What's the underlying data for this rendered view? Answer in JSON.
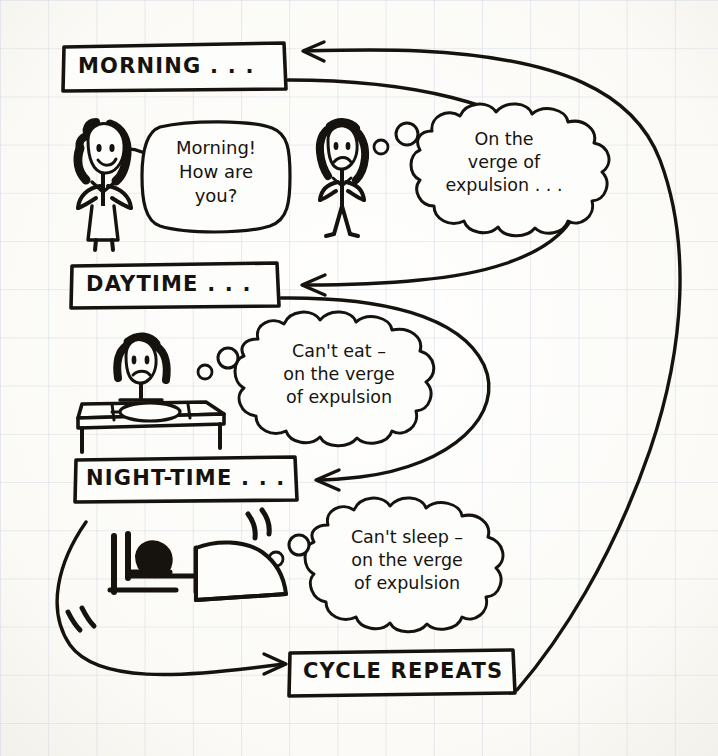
{
  "page": {
    "paper_color": "#fbfaf7",
    "grid_color": "#c9d2dd",
    "ink_color": "#16130f"
  },
  "stages": [
    {
      "id": "morning",
      "label": "MORNING . . .",
      "box": {
        "x": 62,
        "y": 44,
        "w": 222,
        "h": 46
      }
    },
    {
      "id": "daytime",
      "label": "DAYTIME . . .",
      "box": {
        "x": 70,
        "y": 263,
        "w": 208,
        "h": 44
      }
    },
    {
      "id": "nighttime",
      "label": "NIGHT-TIME . . .",
      "box": {
        "x": 74,
        "y": 457,
        "w": 222,
        "h": 44
      }
    },
    {
      "id": "cycle-repeats",
      "label": "CYCLE REPEATS",
      "box": {
        "x": 288,
        "y": 650,
        "w": 226,
        "h": 44
      }
    }
  ],
  "speech_bubbles": [
    {
      "id": "morning-greeting",
      "kind": "speech",
      "text": "Morning!\nHow are\nyou?",
      "box": {
        "x": 146,
        "y": 124,
        "w": 138,
        "h": 104
      }
    }
  ],
  "thought_bubbles": [
    {
      "id": "morning-thought",
      "kind": "thought",
      "text": "On the\nverge of\nexpulsion . . .",
      "box": {
        "x": 424,
        "y": 112,
        "w": 160,
        "h": 112
      },
      "dots": [
        {
          "cx": 381,
          "cy": 147,
          "r": 7
        },
        {
          "cx": 407,
          "cy": 134,
          "r": 11
        }
      ]
    },
    {
      "id": "daytime-thought",
      "kind": "thought",
      "text": "Can't eat –\non the verge\nof expulsion",
      "box": {
        "x": 248,
        "y": 322,
        "w": 186,
        "h": 110
      },
      "dots": [
        {
          "cx": 205,
          "cy": 372,
          "r": 7
        },
        {
          "cx": 228,
          "cy": 358,
          "r": 10
        }
      ]
    },
    {
      "id": "nighttime-thought",
      "kind": "thought",
      "text": "Can't sleep –\non the verge\nof expulsion",
      "box": {
        "x": 318,
        "y": 508,
        "w": 182,
        "h": 108
      },
      "dots": [
        {
          "cx": 276,
          "cy": 559,
          "r": 7
        },
        {
          "cx": 299,
          "cy": 545,
          "r": 10
        }
      ]
    }
  ],
  "figures": [
    {
      "id": "happy-person",
      "name": "smiling-stick-figure-with-bun",
      "mood": "happy",
      "origin": {
        "x": 72,
        "y": 118
      }
    },
    {
      "id": "worried-person",
      "name": "worried-stick-figure",
      "mood": "worried",
      "origin": {
        "x": 318,
        "y": 120
      }
    },
    {
      "id": "table-scene",
      "name": "person-at-table-with-plate",
      "mood": "worried",
      "origin": {
        "x": 78,
        "y": 330
      }
    },
    {
      "id": "bed-scene",
      "name": "person-awake-in-bed",
      "mood": "restless",
      "origin": {
        "x": 96,
        "y": 520
      }
    }
  ],
  "arrows": [
    {
      "id": "cycle-to-morning",
      "name": "cycle-repeats-to-morning-arrow",
      "from": "cycle-repeats",
      "to": "morning"
    },
    {
      "id": "morning-to-daytime",
      "name": "morning-to-daytime-arrow",
      "from": "morning",
      "to": "daytime"
    },
    {
      "id": "daytime-to-nighttime",
      "name": "daytime-to-nighttime-arrow",
      "from": "daytime",
      "to": "nighttime"
    },
    {
      "id": "nighttime-to-cycle",
      "name": "nighttime-to-cycle-repeats-arrow",
      "from": "nighttime",
      "to": "cycle-repeats"
    }
  ]
}
